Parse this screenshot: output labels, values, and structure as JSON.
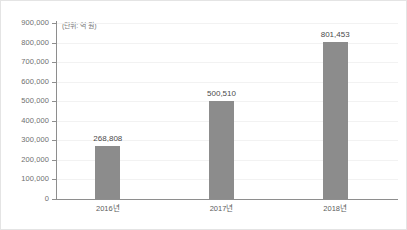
{
  "chart_data": {
    "type": "bar",
    "title": "",
    "subtitle": "",
    "unit_note": "(단위: 억 원)",
    "categories": [
      "2016년",
      "2017년",
      "2018년"
    ],
    "values": [
      268808,
      500510,
      801453
    ],
    "value_labels": [
      "268,808",
      "500,510",
      "801,453"
    ],
    "xlabel": "",
    "ylabel": "",
    "ylim": [
      0,
      900000
    ],
    "ytick_values": [
      0,
      100000,
      200000,
      300000,
      400000,
      500000,
      600000,
      700000,
      800000,
      900000
    ],
    "ytick_labels": [
      "0",
      "100,000",
      "200,000",
      "300,000",
      "400,000",
      "500,000",
      "600,000",
      "700,000",
      "800,000",
      "900,000"
    ],
    "grid": true,
    "legend": false,
    "legend_position": "none",
    "bar_color": "#8c8c8c",
    "axis_color": "#8e8e8e",
    "grid_color": "#f2f2f2",
    "tick_label_color": "#6f6f6f",
    "value_label_color": "#4a4a4a",
    "background_color": "#ffffff",
    "border_color": "#e4e4e4"
  }
}
